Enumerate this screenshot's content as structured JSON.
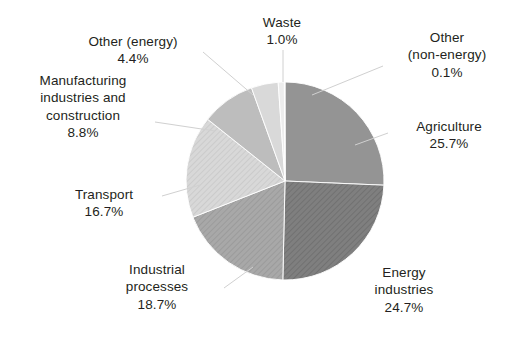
{
  "chart_data": {
    "type": "pie",
    "title": "",
    "subtitle": "",
    "xlabel": "",
    "ylabel": "",
    "legend_position": "none",
    "grid": false,
    "start_angle_deg": 0,
    "direction": "clockwise",
    "units": "percent",
    "categories": [
      "Agriculture",
      "Energy industries",
      "Industrial processes",
      "Transport",
      "Manufacturing industries and construction",
      "Other (energy)",
      "Waste",
      "Other (non-energy)"
    ],
    "values": [
      25.7,
      24.7,
      18.7,
      16.7,
      8.8,
      4.4,
      1.0,
      0.1
    ],
    "slices": [
      {
        "name": "Agriculture",
        "label_text": "Agriculture",
        "value": 25.7,
        "value_text": "25.7%",
        "fill": "#949494",
        "hatch": false
      },
      {
        "name": "Energy industries",
        "label_text": "Energy\nindustries",
        "value": 24.7,
        "value_text": "24.7%",
        "fill": "#7f7f7f",
        "hatch": true
      },
      {
        "name": "Industrial processes",
        "label_text": "Industrial\nprocesses",
        "value": 18.7,
        "value_text": "18.7%",
        "fill": "#a6a6a6",
        "hatch": true
      },
      {
        "name": "Transport",
        "label_text": "Transport",
        "value": 16.7,
        "value_text": "16.7%",
        "fill": "#d4d4d4",
        "hatch": true
      },
      {
        "name": "Manufacturing industries and construction",
        "label_text": "Manufacturing\nindustries and\nconstruction",
        "value": 8.8,
        "value_text": "8.8%",
        "fill": "#bdbdbd",
        "hatch": false
      },
      {
        "name": "Other (energy)",
        "label_text": "Other (energy)",
        "value": 4.4,
        "value_text": "4.4%",
        "fill": "#d9d9d9",
        "hatch": false
      },
      {
        "name": "Waste",
        "label_text": "Waste",
        "value": 1.0,
        "value_text": "1.0%",
        "fill": "#ededed",
        "hatch": false
      },
      {
        "name": "Other (non-energy)",
        "label_text": "Other\n(non-energy)",
        "value": 0.1,
        "value_text": "0.1%",
        "fill": "#f2f2f2",
        "hatch": false
      }
    ],
    "geometry": {
      "center_x": 285,
      "center_y": 181,
      "radius": 99
    },
    "labels": [
      {
        "key": "waste",
        "name": "Waste",
        "value_text": "1.0%",
        "x": 237,
        "y": 14,
        "w": 90,
        "leader": [
          [
            283,
            50
          ],
          [
            283,
            82
          ]
        ]
      },
      {
        "key": "other_energy",
        "name": "Other (energy)",
        "value_text": "4.4%",
        "x": 63,
        "y": 33,
        "w": 140,
        "leader": [
          [
            203,
            52
          ],
          [
            253,
            95
          ]
        ]
      },
      {
        "key": "manufacturing",
        "name": "Manufacturing\nindustries and\nconstruction",
        "value_text": "8.8%",
        "x": 13,
        "y": 72,
        "w": 140,
        "leader": [
          [
            155,
            122
          ],
          [
            215,
            131
          ]
        ]
      },
      {
        "key": "transport",
        "name": "Transport",
        "value_text": "16.7%",
        "x": 48,
        "y": 186,
        "w": 112,
        "leader": [
          [
            162,
            196
          ],
          [
            200,
            185
          ]
        ]
      },
      {
        "key": "industrial",
        "name": "Industrial\nprocesses",
        "value_text": "18.7%",
        "x": 92,
        "y": 261,
        "w": 130,
        "leader": [
          [
            224,
            288
          ],
          [
            253,
            267
          ]
        ]
      },
      {
        "key": "energy_ind",
        "name": "Energy\nindustries",
        "value_text": "24.7%",
        "x": 341,
        "y": 264,
        "w": 126,
        "leader": null
      },
      {
        "key": "agriculture",
        "name": "Agriculture",
        "value_text": "25.7%",
        "x": 391,
        "y": 118,
        "w": 116,
        "leader": [
          [
            388,
            133
          ],
          [
            355,
            145
          ]
        ]
      },
      {
        "key": "other_nonen",
        "name": "Other\n(non-energy)",
        "value_text": "0.1%",
        "x": 386,
        "y": 29,
        "w": 122,
        "leader": [
          [
            383,
            66
          ],
          [
            312,
            95
          ]
        ]
      }
    ]
  }
}
